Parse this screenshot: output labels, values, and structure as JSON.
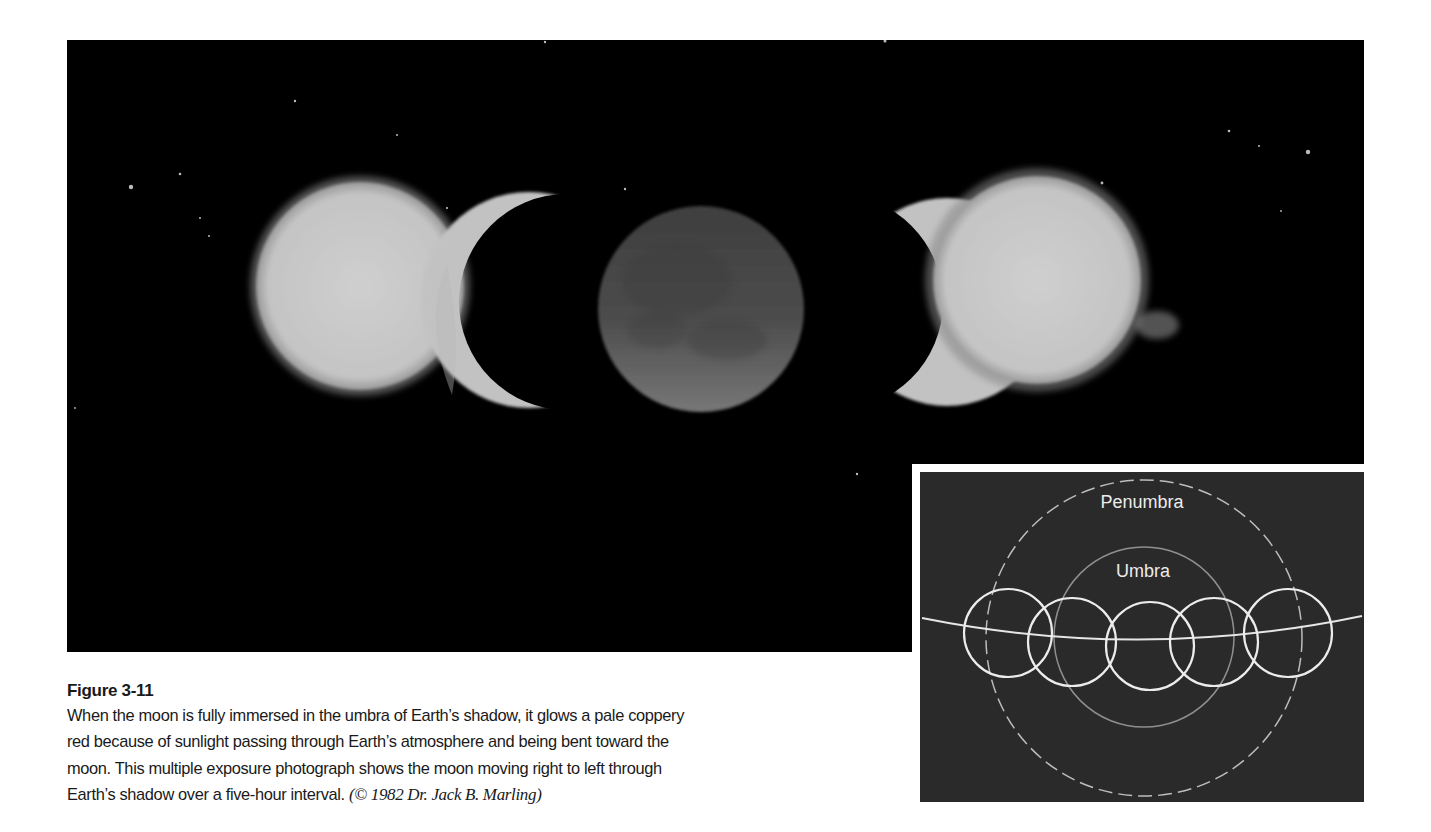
{
  "figure": {
    "title": "Figure 3-11",
    "caption_lines": [
      "When the moon is fully immersed in the umbra of Earth’s shadow, it glows a pale coppery",
      "red because of sunlight passing through Earth’s atmosphere and being bent toward the",
      "moon. This multiple exposure photograph shows the moon moving right to left through",
      "Earth’s shadow over a five-hour interval."
    ],
    "credit": "(© 1982 Dr. Jack B. Marling)"
  },
  "photo": {
    "description": "Multiple exposure photograph of lunar eclipse",
    "background_color": "#000000",
    "moon_color": "#c8c8c8",
    "eclipsed_moon_color": "#5a5a5a"
  },
  "inset": {
    "labels": {
      "penumbra": "Penumbra",
      "umbra": "Umbra"
    },
    "background_color": "#2a2a2a",
    "line_color": "#e8e8e8"
  }
}
